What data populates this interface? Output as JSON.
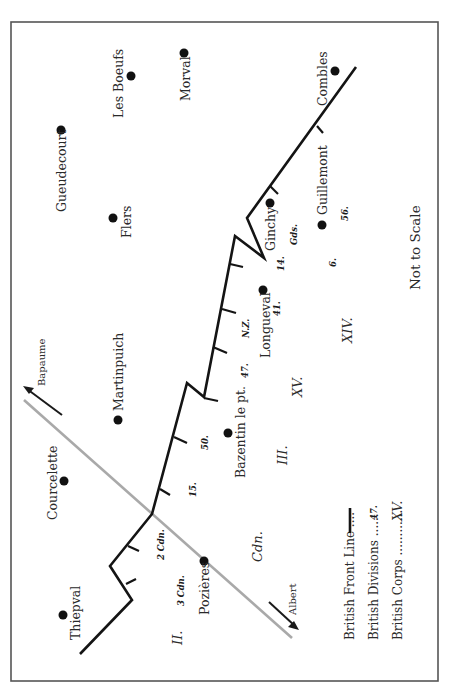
{
  "map": {
    "note": "Not to Scale",
    "roads": {
      "to_bapaume": "Bapaume",
      "to_albert": "Albert"
    },
    "places": {
      "thiepval": "Thiepval",
      "courcelette": "Courcelette",
      "pozieres": "Pozières",
      "martinpuich": "Martinpuich",
      "bazentin": "Bazentin le pt.",
      "flers": "Flers",
      "gueudecourt": "Gueudecourt",
      "les_boeufs": "Les Boeufs",
      "morval": "Morval",
      "longueval": "Longueval",
      "ginchy": "Ginchy",
      "guillemont": "Guillemont",
      "combles": "Combles"
    },
    "divisions": {
      "cdn3": "3 Cdn.",
      "cdn2": "2 Cdn.",
      "d15": "15.",
      "d50": "50.",
      "d47": "47.",
      "nz": "N.Z.",
      "d41": "41.",
      "d14": "14.",
      "gds": "Gds.",
      "d6": "6.",
      "d56": "56."
    },
    "corps": {
      "ii": "II.",
      "cdn": "Cdn.",
      "iii": "III.",
      "xv": "XV.",
      "xiv": "XIV."
    },
    "legend": {
      "front_line": "British Front Line ....",
      "divisions": "British Divisions ......",
      "divisions_sample": "47.",
      "corps": "British Corps ............",
      "corps_sample": "XV."
    },
    "colors": {
      "front_line": "#141414",
      "road": "#a9a9a9",
      "frame": "#555555",
      "text": "#2a2a2a"
    }
  }
}
